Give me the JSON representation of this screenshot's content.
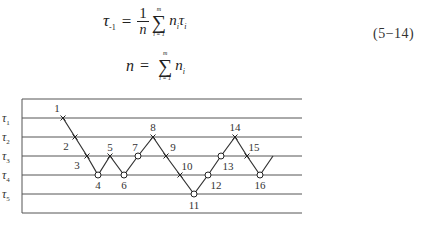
{
  "equations": [
    {
      "id": "5-14",
      "lhs": "τ",
      "lhs_sub": "-1",
      "equals": "=",
      "frac_num": "1",
      "frac_den": "n",
      "sum_upper": "m",
      "sum_lower": "i = 1",
      "sigma": "∑",
      "term": "n",
      "term_sub": "i",
      "term2": "τ",
      "term2_sub": "i",
      "number": "(5−14)"
    },
    {
      "lhs": "n",
      "equals": "=",
      "sum_upper": "m",
      "sum_lower": "i = 1",
      "sigma": "∑",
      "term": "n",
      "term_sub": "i"
    }
  ],
  "figure": {
    "caption": "",
    "frame": {
      "left": 22,
      "top": 99,
      "right": 302,
      "bottom": 213
    },
    "levels": [
      {
        "label": "τ",
        "sub": "1",
        "y": 118
      },
      {
        "label": "τ",
        "sub": "2",
        "y": 137
      },
      {
        "label": "τ",
        "sub": "3",
        "y": 156
      },
      {
        "label": "τ",
        "sub": "4",
        "y": 175
      },
      {
        "label": "τ",
        "sub": "5",
        "y": 194
      }
    ],
    "line_color": "#333333",
    "grid_color": "#555555"
  },
  "chart_data": {
    "type": "line",
    "title": "",
    "xlabel": "test sequence",
    "ylabel": "stress level",
    "y_levels": [
      "τ1",
      "τ2",
      "τ3",
      "τ4",
      "τ5"
    ],
    "points": [
      {
        "n": 1,
        "level": 1,
        "result": "failure (×)"
      },
      {
        "n": 2,
        "level": 2,
        "result": "failure (×)"
      },
      {
        "n": 3,
        "level": 3,
        "result": "failure (×)"
      },
      {
        "n": 4,
        "level": 4,
        "result": "run-out (○)"
      },
      {
        "n": 5,
        "level": 3,
        "result": "failure (×)"
      },
      {
        "n": 6,
        "level": 4,
        "result": "run-out (○)"
      },
      {
        "n": 7,
        "level": 3,
        "result": "run-out (○)"
      },
      {
        "n": 8,
        "level": 2,
        "result": "failure (×)"
      },
      {
        "n": 9,
        "level": 3,
        "result": "failure (×)"
      },
      {
        "n": 10,
        "level": 4,
        "result": "failure (×)"
      },
      {
        "n": 11,
        "level": 5,
        "result": "run-out (○)"
      },
      {
        "n": 12,
        "level": 4,
        "result": "run-out (○)"
      },
      {
        "n": 13,
        "level": 3,
        "result": "run-out (○)"
      },
      {
        "n": 14,
        "level": 2,
        "result": "failure (×)"
      },
      {
        "n": 15,
        "level": 3,
        "result": "failure (×)"
      },
      {
        "n": 16,
        "level": 4,
        "result": "run-out (○)"
      }
    ],
    "trailing_segment_to_level": 3,
    "grid": true,
    "legend": "none"
  },
  "plot_points": [
    {
      "label": "1",
      "x": 63,
      "y": 118,
      "mark": "x",
      "lx": 57,
      "ly": 112
    },
    {
      "label": "2",
      "x": 75,
      "y": 137,
      "mark": "x",
      "lx": 66,
      "ly": 150
    },
    {
      "label": "3",
      "x": 87,
      "y": 156,
      "mark": "x",
      "lx": 77,
      "ly": 169
    },
    {
      "label": "4",
      "x": 98,
      "y": 175,
      "mark": "o",
      "lx": 98,
      "ly": 189
    },
    {
      "label": "5",
      "x": 110,
      "y": 156,
      "mark": "x",
      "lx": 110,
      "ly": 151
    },
    {
      "label": "6",
      "x": 124,
      "y": 175,
      "mark": "o",
      "lx": 124,
      "ly": 189
    },
    {
      "label": "7",
      "x": 138,
      "y": 156,
      "mark": "o",
      "lx": 135,
      "ly": 151
    },
    {
      "label": "8",
      "x": 153,
      "y": 137,
      "mark": "x",
      "lx": 153,
      "ly": 131
    },
    {
      "label": "9",
      "x": 166,
      "y": 156,
      "mark": "x",
      "lx": 173,
      "ly": 151
    },
    {
      "label": "10",
      "x": 180,
      "y": 175,
      "mark": "x",
      "lx": 187,
      "ly": 170
    },
    {
      "label": "11",
      "x": 194,
      "y": 194,
      "mark": "o",
      "lx": 194,
      "ly": 209
    },
    {
      "label": "12",
      "x": 208,
      "y": 175,
      "mark": "o",
      "lx": 216,
      "ly": 189
    },
    {
      "label": "13",
      "x": 221,
      "y": 156,
      "mark": "o",
      "lx": 228,
      "ly": 170
    },
    {
      "label": "14",
      "x": 235,
      "y": 137,
      "mark": "x",
      "lx": 235,
      "ly": 131
    },
    {
      "label": "15",
      "x": 247,
      "y": 156,
      "mark": "x",
      "lx": 254,
      "ly": 151
    },
    {
      "label": "16",
      "x": 260,
      "y": 175,
      "mark": "o",
      "lx": 260,
      "ly": 189
    }
  ],
  "trailing_end": {
    "x": 273,
    "y": 156
  }
}
